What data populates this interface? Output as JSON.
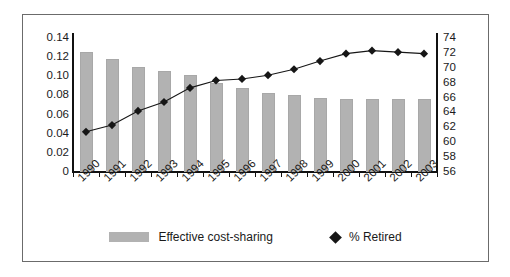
{
  "chart_data": {
    "type": "bar",
    "title": "",
    "subtitle": "",
    "xlabel": "",
    "ylabel": "",
    "y2label": "",
    "grid": false,
    "legend_position": "bottom",
    "categories": [
      "1990",
      "1991",
      "1992",
      "1993",
      "1994",
      "1995",
      "1996",
      "1997",
      "1998",
      "1999",
      "2000",
      "2001",
      "2002",
      "2003"
    ],
    "left_axis": {
      "ticks": [
        "0.14",
        "0.12",
        "0.10",
        "0.08",
        "0.06",
        "0.04",
        "0.02",
        "0"
      ],
      "tick_values": [
        0.14,
        0.12,
        0.1,
        0.08,
        0.06,
        0.04,
        0.02,
        0
      ],
      "ylim": [
        0,
        0.14
      ]
    },
    "right_axis": {
      "ticks": [
        "74",
        "72",
        "70",
        "68",
        "66",
        "64",
        "62",
        "60",
        "58",
        "56"
      ],
      "tick_values": [
        74,
        72,
        70,
        68,
        66,
        64,
        62,
        60,
        58,
        56
      ],
      "ylim": [
        56,
        74
      ]
    },
    "series": [
      {
        "name": "Effective cost-sharing",
        "kind": "bar",
        "axis": "left",
        "color": "#b2b2b2",
        "values": [
          0.125,
          0.118,
          0.11,
          0.106,
          0.101,
          0.093,
          0.088,
          0.083,
          0.08,
          0.077,
          0.076,
          0.076,
          0.076,
          0.076
        ]
      },
      {
        "name": "% Retired",
        "kind": "line",
        "axis": "right",
        "color": "#161616",
        "marker": "diamond",
        "values": [
          61.4,
          62.3,
          64.2,
          65.4,
          67.3,
          68.3,
          68.5,
          69.0,
          69.8,
          70.9,
          71.9,
          72.3,
          72.1,
          71.9
        ]
      }
    ]
  },
  "legend": {
    "entries": [
      {
        "label": "Effective cost-sharing",
        "marker": "bar-swatch"
      },
      {
        "label": "% Retired",
        "marker": "diamond"
      }
    ]
  }
}
